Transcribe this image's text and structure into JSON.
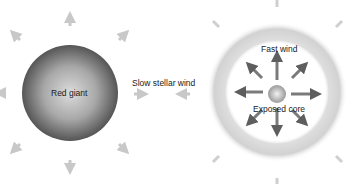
{
  "diagram": {
    "left_star": {
      "label": "Red giant"
    },
    "middle": {
      "label": "Slow stellar wind"
    },
    "right_star": {
      "fast_label": "Fast wind",
      "core_label": "Exposed core"
    },
    "colors": {
      "red_giant_center": "#d9d9d9",
      "red_giant_edge": "#5a5a5a",
      "slow_arrow": "#c8c8c8",
      "fast_arrow": "#6e6e6e",
      "shell": "#d4d4d4",
      "core": "#bdbdbd"
    }
  }
}
